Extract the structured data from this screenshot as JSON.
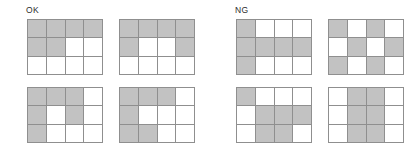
{
  "figure": {
    "width": 418,
    "height": 156,
    "background_color": "#ffffff",
    "grid_line_color": "#8f8f8f",
    "filled_cell_color": "#c2c2c2",
    "empty_cell_color": "#ffffff"
  },
  "groups": [
    {
      "id": "ok",
      "label": "OK",
      "grids": [
        {
          "id": "ok-grid-1",
          "position": "top-left",
          "rows": 3,
          "cols": 4,
          "cells": [
            [
              1,
              1,
              1,
              1
            ],
            [
              1,
              1,
              0,
              0
            ],
            [
              0,
              0,
              0,
              0
            ]
          ]
        },
        {
          "id": "ok-grid-2",
          "position": "top-right",
          "rows": 3,
          "cols": 4,
          "cells": [
            [
              1,
              1,
              1,
              1
            ],
            [
              1,
              0,
              0,
              1
            ],
            [
              0,
              0,
              0,
              0
            ]
          ]
        },
        {
          "id": "ok-grid-3",
          "position": "bottom-left",
          "rows": 3,
          "cols": 4,
          "cells": [
            [
              1,
              1,
              1,
              0
            ],
            [
              1,
              0,
              1,
              0
            ],
            [
              1,
              0,
              0,
              0
            ]
          ]
        },
        {
          "id": "ok-grid-4",
          "position": "bottom-right",
          "rows": 3,
          "cols": 4,
          "cells": [
            [
              1,
              1,
              1,
              0
            ],
            [
              1,
              0,
              0,
              0
            ],
            [
              1,
              1,
              0,
              0
            ]
          ]
        }
      ]
    },
    {
      "id": "ng",
      "label": "NG",
      "grids": [
        {
          "id": "ng-grid-1",
          "position": "top-left",
          "rows": 3,
          "cols": 4,
          "cells": [
            [
              1,
              0,
              0,
              0
            ],
            [
              1,
              1,
              1,
              1
            ],
            [
              1,
              0,
              0,
              0
            ]
          ]
        },
        {
          "id": "ng-grid-2",
          "position": "top-right",
          "rows": 3,
          "cols": 4,
          "cells": [
            [
              1,
              0,
              1,
              0
            ],
            [
              0,
              1,
              0,
              1
            ],
            [
              1,
              0,
              1,
              0
            ]
          ]
        },
        {
          "id": "ng-grid-3",
          "position": "bottom-left",
          "rows": 3,
          "cols": 4,
          "cells": [
            [
              1,
              0,
              0,
              0
            ],
            [
              0,
              1,
              1,
              1
            ],
            [
              0,
              1,
              1,
              0
            ]
          ]
        },
        {
          "id": "ng-grid-4",
          "position": "bottom-right",
          "rows": 3,
          "cols": 4,
          "cells": [
            [
              0,
              1,
              1,
              0
            ],
            [
              0,
              1,
              1,
              0
            ],
            [
              0,
              1,
              1,
              0
            ]
          ]
        }
      ]
    }
  ]
}
